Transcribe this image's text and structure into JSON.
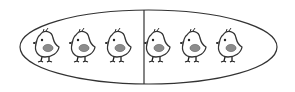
{
  "diagram": {
    "groups": [
      {
        "label": "left",
        "count": 3
      },
      {
        "label": "right",
        "count": 3
      }
    ],
    "total": 6,
    "colors": {
      "stroke": "#333333",
      "wing": "#8c8c8c",
      "background": "#ffffff"
    },
    "chicks": [
      {
        "x": 46,
        "y": 47
      },
      {
        "x": 82,
        "y": 47
      },
      {
        "x": 118,
        "y": 47
      },
      {
        "x": 157,
        "y": 47
      },
      {
        "x": 193,
        "y": 47
      },
      {
        "x": 229,
        "y": 47
      }
    ]
  }
}
